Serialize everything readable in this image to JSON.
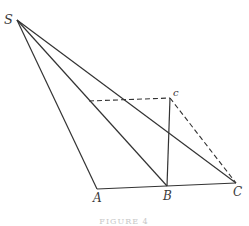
{
  "diagram": {
    "type": "geometry",
    "points": {
      "S": {
        "label": "S",
        "x": 17,
        "y": 20,
        "lx": 4,
        "ly": 24
      },
      "A": {
        "label": "A",
        "x": 97,
        "y": 189,
        "lx": 93,
        "ly": 202
      },
      "B": {
        "label": "B",
        "x": 167,
        "y": 186,
        "lx": 163,
        "ly": 200
      },
      "C": {
        "label": "C",
        "x": 236,
        "y": 183,
        "lx": 233,
        "ly": 196
      },
      "c": {
        "label": "c",
        "x": 170,
        "y": 98,
        "lx": 173,
        "ly": 96
      },
      "d": {
        "label": "",
        "x": 89,
        "y": 101
      }
    },
    "solid_lines": [
      [
        "S",
        "A"
      ],
      [
        "S",
        "B"
      ],
      [
        "S",
        "C"
      ],
      [
        "A",
        "C"
      ],
      [
        "B",
        "c"
      ]
    ],
    "dashed_lines": [
      [
        "d",
        "c"
      ],
      [
        "c",
        "C"
      ]
    ],
    "line_color": "#333333",
    "caption": "FIGURE 4"
  }
}
